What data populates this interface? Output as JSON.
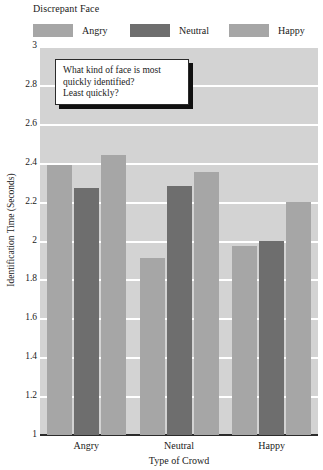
{
  "legend": {
    "title": "Discrepant Face",
    "items": [
      {
        "label": "Angry",
        "color": "#a6a6a6"
      },
      {
        "label": "Neutral",
        "color": "#6e6e6e"
      },
      {
        "label": "Happy",
        "color": "#a6a6a6"
      }
    ]
  },
  "annotation": {
    "line1": "What kind of face is most",
    "line2": "quickly identified?",
    "line3": "Least quickly?"
  },
  "axes": {
    "y_title": "Identification Time (Seconds)",
    "x_title": "Type of Crowd",
    "y_ticks": [
      "3",
      "2.8",
      "2.6",
      "2.4",
      "2.2",
      "2",
      "1.8",
      "1.6",
      "1.4",
      "1.2",
      "1"
    ],
    "x_ticks": [
      "Angry",
      "Neutral",
      "Happy"
    ]
  },
  "chart_data": {
    "type": "bar",
    "title": "",
    "xlabel": "Type of Crowd",
    "ylabel": "Identification Time (Seconds)",
    "ylim": [
      1,
      3
    ],
    "ytick_step": 0.2,
    "grid": true,
    "legend_title": "Discrepant Face",
    "legend_position": "top",
    "categories": [
      "Angry",
      "Neutral",
      "Happy"
    ],
    "series": [
      {
        "name": "Angry",
        "color": "#a6a6a6",
        "values": [
          2.39,
          1.91,
          1.97
        ]
      },
      {
        "name": "Neutral",
        "color": "#6e6e6e",
        "values": [
          2.27,
          2.28,
          2.0
        ]
      },
      {
        "name": "Happy",
        "color": "#a6a6a6",
        "values": [
          2.44,
          2.35,
          2.2
        ]
      }
    ],
    "annotation_text": "What kind of face is most quickly identified? Least quickly?"
  }
}
